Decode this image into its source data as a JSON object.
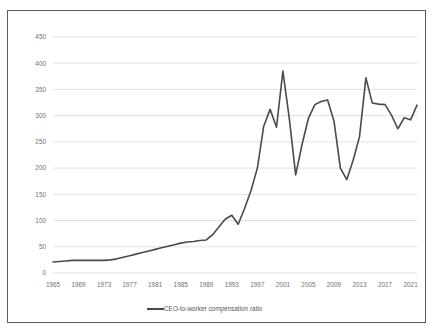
{
  "chart_data": {
    "type": "line",
    "title": "",
    "subtitle": "",
    "xlabel": "",
    "ylabel": "",
    "xlim": [
      1965,
      2022
    ],
    "ylim": [
      0,
      450
    ],
    "grid": "horizontal",
    "legend_position": "bottom-center",
    "legend": [
      "CEO-to-worker compensation ratio"
    ],
    "y_ticks": [
      0,
      50,
      100,
      150,
      200,
      250,
      300,
      350,
      400,
      450
    ],
    "y_tick_labels": [
      "0",
      "50",
      "100",
      "150",
      "200",
      "250",
      "300",
      "350",
      "400",
      "450"
    ],
    "x_ticks": [
      1965,
      1969,
      1973,
      1977,
      1981,
      1985,
      1989,
      1993,
      1997,
      2001,
      2005,
      2009,
      2013,
      2017,
      2021
    ],
    "x_tick_labels": [
      "1965",
      "1969",
      "1973",
      "1977",
      "1981",
      "1985",
      "1989",
      "1993",
      "1997",
      "2001",
      "2005",
      "2009",
      "2013",
      "2017",
      "2021"
    ],
    "x": [
      1965,
      1966,
      1967,
      1968,
      1969,
      1970,
      1971,
      1972,
      1973,
      1974,
      1975,
      1976,
      1977,
      1978,
      1979,
      1980,
      1981,
      1982,
      1983,
      1984,
      1985,
      1986,
      1987,
      1988,
      1989,
      1990,
      1991,
      1992,
      1993,
      1994,
      1995,
      1996,
      1997,
      1998,
      1999,
      2000,
      2001,
      2002,
      2003,
      2004,
      2005,
      2006,
      2007,
      2008,
      2009,
      2010,
      2011,
      2012,
      2013,
      2014,
      2015,
      2016,
      2017,
      2018,
      2019,
      2020,
      2021,
      2022
    ],
    "series": [
      {
        "name": "CEO-to-worker compensation ratio",
        "color": "#4a4a4a",
        "values": [
          21,
          22,
          23,
          24,
          24,
          24,
          24,
          24,
          24,
          25,
          27,
          30,
          33,
          36,
          39,
          42,
          45,
          48,
          51,
          54,
          57,
          59,
          60,
          62,
          63,
          73,
          88,
          103,
          110,
          93,
          123,
          157,
          200,
          280,
          312,
          278,
          385,
          295,
          187,
          245,
          295,
          321,
          327,
          330,
          290,
          200,
          178,
          215,
          260,
          372,
          324,
          322,
          321,
          301,
          275,
          296,
          292,
          320
        ]
      }
    ],
    "annotations": {
      "peak_2001_value": 385,
      "trough_2003_value": 187,
      "trough_2011_value": 178,
      "peak_2021_value": 393,
      "end_2022_value": 350
    }
  },
  "legend": {
    "entry_label": "CEO-to-worker compensation ratio"
  }
}
